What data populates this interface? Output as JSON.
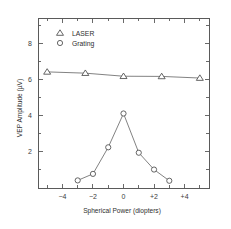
{
  "chart_data": {
    "type": "line",
    "title": "",
    "xlabel": "Spherical Power (diopters)",
    "ylabel": "VEP Amplitude (µV)",
    "xlim": [
      -5.6,
      5.6
    ],
    "ylim": [
      0,
      9.4
    ],
    "grid": false,
    "legend_position": "top-left-inside",
    "x_major_ticks": [
      -4,
      -2,
      0,
      2,
      4
    ],
    "x_major_tick_labels": [
      "−4",
      "−2",
      "0",
      "+2",
      "+4"
    ],
    "x_minor_ticks": [
      -5,
      -3,
      -1,
      1,
      3,
      5
    ],
    "y_major_ticks": [
      2,
      4,
      6,
      8
    ],
    "y_major_tick_labels": [
      "2",
      "4",
      "6",
      "8"
    ],
    "y_minor_ticks": [
      1,
      3,
      5,
      7,
      9
    ],
    "series": [
      {
        "name": "LASER",
        "marker": "triangle-open",
        "x": [
          -5,
          -2.5,
          0,
          2.5,
          5
        ],
        "values": [
          6.42,
          6.35,
          6.18,
          6.17,
          6.08
        ]
      },
      {
        "name": "Grating",
        "marker": "circle-open",
        "x": [
          -3,
          -2,
          -1,
          0,
          1,
          2,
          3
        ],
        "values": [
          0.42,
          0.78,
          2.25,
          4.12,
          1.95,
          1.02,
          0.4
        ]
      }
    ],
    "legend": [
      {
        "label": "LASER",
        "marker": "triangle-open"
      },
      {
        "label": "Grating",
        "marker": "circle-open"
      }
    ],
    "colors": {
      "line": "#6b6b6b",
      "marker_stroke": "#4a4a4a",
      "marker_fill": "#ffffff",
      "axis": "#5a5a5a",
      "text": "#2e2e2e",
      "background": "#ffffff"
    }
  }
}
